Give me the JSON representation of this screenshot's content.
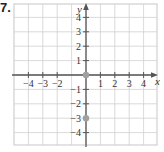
{
  "problem": {
    "number": "7."
  },
  "chart_data": {
    "type": "scatter",
    "title": "",
    "xlabel": "x",
    "ylabel": "y",
    "xlim": [
      -5,
      5
    ],
    "ylim": [
      -5,
      5
    ],
    "grid": true,
    "x_ticks": [
      -4,
      -3,
      -2,
      1,
      2,
      3,
      4
    ],
    "y_ticks": [
      4,
      3,
      2,
      1,
      -1,
      -2,
      -3,
      -4
    ],
    "x_tick_labels": [
      "−4",
      "−3",
      "−2",
      "1",
      "2",
      "3",
      "4"
    ],
    "y_tick_labels": [
      "4",
      "3",
      "2",
      "1",
      "−1",
      "−2",
      "−3",
      "−4"
    ],
    "points": [
      {
        "x": 0,
        "y": 0
      },
      {
        "x": 0,
        "y": -3
      }
    ],
    "colors": {
      "grid": "#d0d0d0",
      "axis": "#555555",
      "point": "#a0a0a0"
    }
  }
}
